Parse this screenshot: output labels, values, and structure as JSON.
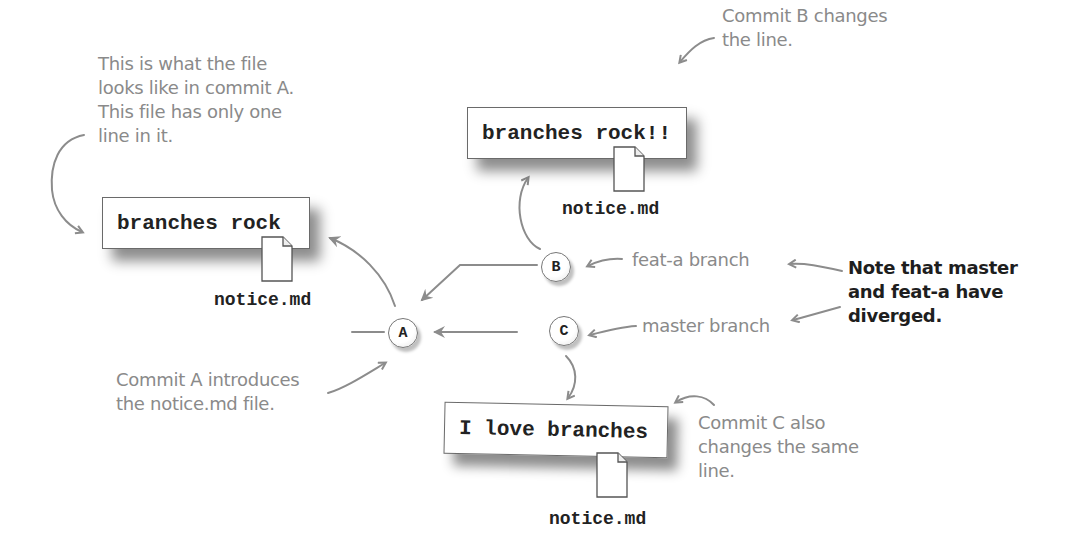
{
  "diagram": {
    "type": "git-branch-divergence",
    "annotations": {
      "commit_a_file": "This is what the file\nlooks like in commit A.\nThis file has only one\nline in it.",
      "commit_b_changes": "Commit B changes\nthe line.",
      "feat_a_branch": "feat-a branch",
      "master_branch": "master branch",
      "diverged_note": "Note that master\nand feat-a have\ndiverged.",
      "commit_a_introduces": "Commit A introduces\nthe notice.md file.",
      "commit_c_changes": "Commit C also\nchanges the same\nline."
    },
    "files": [
      {
        "id": "file-a",
        "content": "branches rock",
        "filename": "notice.md"
      },
      {
        "id": "file-b",
        "content": "branches rock!!",
        "filename": "notice.md"
      },
      {
        "id": "file-c",
        "content": "I love branches",
        "filename": "notice.md"
      }
    ],
    "commits": [
      {
        "id": "A",
        "label": "A"
      },
      {
        "id": "B",
        "label": "B",
        "parent": "A",
        "branch": "feat-a"
      },
      {
        "id": "C",
        "label": "C",
        "parent": "A",
        "branch": "master"
      }
    ],
    "colors": {
      "annotation_text": "#8a8a8a",
      "note_text": "#1e1e1e",
      "arrow": "#8c8c8c",
      "box_border": "#6a6a6a"
    }
  }
}
